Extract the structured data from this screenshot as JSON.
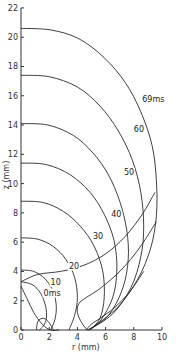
{
  "chart_data": {
    "type": "line",
    "title": "",
    "xlabel": "r (mm)",
    "ylabel": "z (mm)",
    "xlim": [
      0,
      10
    ],
    "ylim": [
      0,
      22
    ],
    "x_ticks": [
      0,
      2,
      4,
      6,
      8,
      10
    ],
    "y_ticks": [
      0,
      2,
      4,
      6,
      8,
      10,
      12,
      14,
      16,
      18,
      20,
      22
    ],
    "grid": false,
    "legend": null,
    "series": [
      {
        "name": "0ms",
        "label": "0ms",
        "points": [
          [
            0,
            3.3
          ],
          [
            0.8,
            3.1
          ],
          [
            1.4,
            2.5
          ],
          [
            1.75,
            1.6
          ],
          [
            1.8,
            0.8
          ],
          [
            1.6,
            0.3
          ],
          [
            1.3,
            0
          ]
        ]
      },
      {
        "name": "10",
        "label": "10",
        "points": [
          [
            0,
            4.1
          ],
          [
            0.9,
            4.0
          ],
          [
            1.7,
            3.5
          ],
          [
            2.3,
            2.6
          ],
          [
            2.5,
            1.6
          ],
          [
            2.4,
            0.7
          ],
          [
            2.1,
            0
          ]
        ]
      },
      {
        "name": "20",
        "label": "20",
        "points": [
          [
            0,
            6.3
          ],
          [
            1.2,
            6.2
          ],
          [
            2.3,
            5.7
          ],
          [
            3.2,
            4.8
          ],
          [
            3.8,
            3.6
          ],
          [
            4.0,
            2.2
          ],
          [
            3.8,
            1.0
          ],
          [
            3.4,
            0
          ]
        ]
      },
      {
        "name": "30",
        "label": "30",
        "points": [
          [
            0,
            8.8
          ],
          [
            1.6,
            8.7
          ],
          [
            3.0,
            8.1
          ],
          [
            4.2,
            7.1
          ],
          [
            5.2,
            5.7
          ],
          [
            5.8,
            4.0
          ],
          [
            5.9,
            2.2
          ],
          [
            5.6,
            0.8
          ],
          [
            4.9,
            0
          ]
        ]
      },
      {
        "name": "40",
        "label": "40",
        "points": [
          [
            0,
            11.4
          ],
          [
            1.8,
            11.3
          ],
          [
            3.5,
            10.6
          ],
          [
            4.9,
            9.4
          ],
          [
            5.9,
            7.9
          ],
          [
            6.6,
            6.1
          ],
          [
            6.8,
            4.1
          ],
          [
            6.5,
            2.2
          ],
          [
            5.6,
            0.6
          ],
          [
            4.7,
            0
          ]
        ]
      },
      {
        "name": "50",
        "label": "50",
        "points": [
          [
            0,
            14.1
          ],
          [
            1.9,
            14.0
          ],
          [
            3.7,
            13.3
          ],
          [
            5.1,
            12.1
          ],
          [
            6.2,
            10.6
          ],
          [
            7.0,
            8.8
          ],
          [
            7.5,
            6.8
          ],
          [
            7.6,
            4.8
          ],
          [
            7.2,
            2.8
          ],
          [
            6.2,
            1.0
          ],
          [
            4.8,
            0
          ]
        ]
      },
      {
        "name": "60",
        "label": "60",
        "points": [
          [
            0,
            17.4
          ],
          [
            2.0,
            17.3
          ],
          [
            4.0,
            16.6
          ],
          [
            5.6,
            15.3
          ],
          [
            6.9,
            13.6
          ],
          [
            7.9,
            11.6
          ],
          [
            8.5,
            9.4
          ],
          [
            8.7,
            7.1
          ],
          [
            8.5,
            5.0
          ],
          [
            7.8,
            2.9
          ],
          [
            6.5,
            1.1
          ],
          [
            4.8,
            0
          ]
        ]
      },
      {
        "name": "69ms",
        "label": "69ms",
        "points": [
          [
            0,
            20.6
          ],
          [
            2.1,
            20.5
          ],
          [
            4.1,
            19.9
          ],
          [
            5.9,
            18.6
          ],
          [
            7.4,
            16.9
          ],
          [
            8.5,
            14.9
          ],
          [
            9.3,
            12.6
          ],
          [
            9.6,
            10.2
          ],
          [
            9.6,
            7.8
          ],
          [
            9.2,
            5.6
          ],
          [
            8.3,
            3.5
          ],
          [
            6.9,
            1.6
          ],
          [
            5.0,
            0.1
          ]
        ]
      },
      {
        "name": "trajectory-a",
        "label": "",
        "points": [
          [
            0,
            3.0
          ],
          [
            0.4,
            2.2
          ],
          [
            0.9,
            1.2
          ],
          [
            1.5,
            0.4
          ],
          [
            2.1,
            0
          ],
          [
            2.7,
            0
          ]
        ]
      },
      {
        "name": "trajectory-b",
        "label": "",
        "points": [
          [
            0,
            3.3
          ],
          [
            1.2,
            3.8
          ],
          [
            2.8,
            4.0
          ],
          [
            4.4,
            4.4
          ],
          [
            6.0,
            5.2
          ],
          [
            7.4,
            6.4
          ],
          [
            8.6,
            7.9
          ],
          [
            9.5,
            9.4
          ]
        ]
      },
      {
        "name": "trajectory-c",
        "label": "",
        "points": [
          [
            4.7,
            0
          ],
          [
            4.3,
            0.5
          ],
          [
            4.0,
            1.2
          ],
          [
            4.1,
            1.8
          ],
          [
            4.6,
            2.2
          ],
          [
            5.7,
            2.9
          ],
          [
            7.1,
            4.1
          ],
          [
            8.4,
            5.6
          ],
          [
            9.6,
            7.4
          ]
        ]
      },
      {
        "name": "trajectory-d",
        "label": "",
        "points": [
          [
            4.6,
            0
          ],
          [
            5.0,
            0.4
          ],
          [
            5.6,
            0.8
          ],
          [
            6.6,
            1.5
          ],
          [
            7.7,
            2.6
          ],
          [
            8.7,
            4.0
          ]
        ]
      },
      {
        "name": "trajectory-e",
        "label": "",
        "points": [
          [
            1.1,
            0
          ],
          [
            1.2,
            0.6
          ],
          [
            1.6,
            0.8
          ],
          [
            2.0,
            0.5
          ],
          [
            2.3,
            0
          ]
        ]
      }
    ],
    "annotations": [
      {
        "text": "0ms",
        "x": 1.6,
        "y": 2.35
      },
      {
        "text": "10",
        "x": 2.1,
        "y": 3.1
      },
      {
        "text": "20",
        "x": 3.4,
        "y": 4.2
      },
      {
        "text": "30",
        "x": 5.1,
        "y": 6.2
      },
      {
        "text": "40",
        "x": 6.4,
        "y": 7.7
      },
      {
        "text": "50",
        "x": 7.3,
        "y": 10.6
      },
      {
        "text": "60",
        "x": 8.0,
        "y": 13.5
      },
      {
        "text": "69ms",
        "x": 8.6,
        "y": 15.6
      }
    ]
  },
  "axes": {
    "x_label": "r  (mm)",
    "y_label": "z (mm)"
  }
}
